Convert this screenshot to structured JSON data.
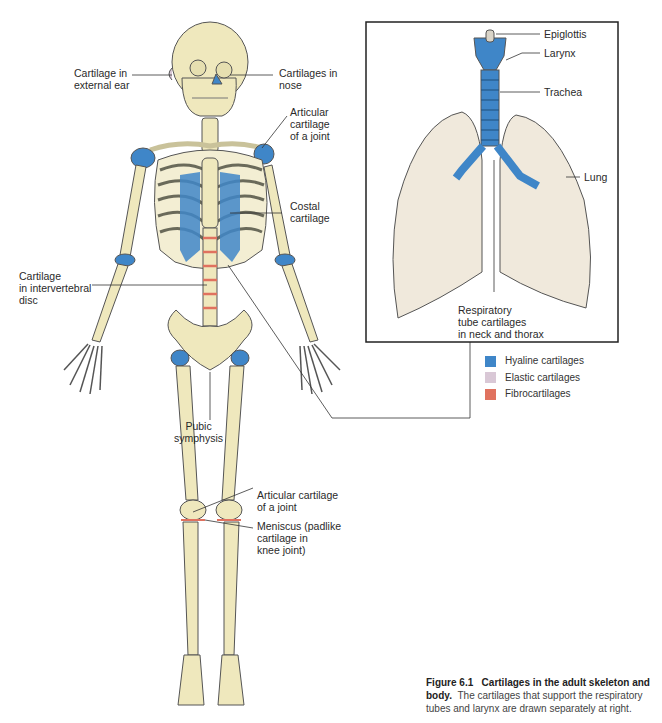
{
  "figure": {
    "title": "Cartilages in the adult skeleton and body",
    "number": "Figure 6.1",
    "caption_bold": "Cartilages in the adult skeleton and body.",
    "caption_rest": "The cartilages that support the respiratory tubes and larynx are drawn separately at right."
  },
  "skeleton_labels": {
    "ear": "Cartilage in\nexternal ear",
    "nose": "Cartilages in\nnose",
    "shoulder": "Articular\ncartilage\nof a joint",
    "costal": "Costal\ncartilage",
    "disc": "Cartilage\nin intervertebral\ndisc",
    "pubic": "Pubic\nsymphysis",
    "knee_articular": "Articular cartilage\nof a joint",
    "meniscus": "Meniscus (padlike\ncartilage in\nknee joint)"
  },
  "inset_labels": {
    "epiglottis": "Epiglottis",
    "larynx": "Larynx",
    "trachea": "Trachea",
    "lung": "Lung",
    "respiratory": "Respiratory\ntube cartilages\nin neck and thorax"
  },
  "legend": [
    {
      "label": "Hyaline cartilages",
      "color": "#3f86c8"
    },
    {
      "label": "Elastic cartilages",
      "color": "#d9c8d6"
    },
    {
      "label": "Fibrocartilages",
      "color": "#e0725f"
    }
  ],
  "colors": {
    "bone": "#efe8bd",
    "bone_outline": "#555555",
    "hyaline": "#3f86c8",
    "lung": "#f0e9dc"
  }
}
